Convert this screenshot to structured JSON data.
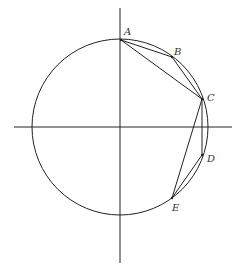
{
  "diagram": {
    "type": "geometry",
    "colors": {
      "stroke": "#222222",
      "background": "#ffffff",
      "label": "#333333"
    },
    "axes": {
      "horizontal": {
        "x1": 14,
        "y1": 127,
        "x2": 232,
        "y2": 127
      },
      "vertical": {
        "x1": 120,
        "y1": 8,
        "x2": 120,
        "y2": 263
      }
    },
    "circle": {
      "cx": 120,
      "cy": 127,
      "r": 88
    },
    "points": [
      {
        "id": "A",
        "label": "A",
        "x": 121,
        "y": 40,
        "label_x": 124,
        "label_y": 35
      },
      {
        "id": "B",
        "label": "B",
        "x": 172,
        "y": 57,
        "label_x": 174,
        "label_y": 55
      },
      {
        "id": "C",
        "label": "C",
        "x": 202,
        "y": 99,
        "label_x": 207,
        "label_y": 101
      },
      {
        "id": "D",
        "label": "D",
        "x": 202,
        "y": 155,
        "label_x": 207,
        "label_y": 162
      },
      {
        "id": "E",
        "label": "E",
        "x": 172,
        "y": 198,
        "label_x": 172,
        "label_y": 211
      }
    ],
    "segments": [
      {
        "from": "A",
        "to": "B"
      },
      {
        "from": "B",
        "to": "C"
      },
      {
        "from": "A",
        "to": "C"
      },
      {
        "from": "C",
        "to": "D"
      },
      {
        "from": "D",
        "to": "E"
      },
      {
        "from": "C",
        "to": "E"
      }
    ]
  }
}
